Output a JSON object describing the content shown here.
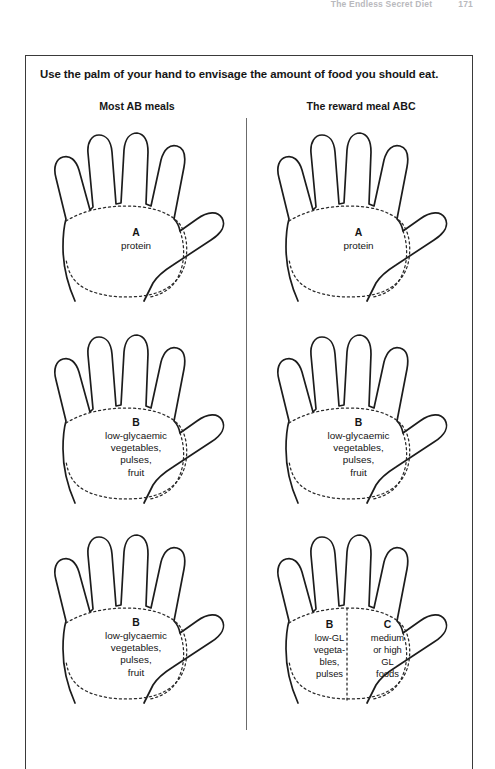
{
  "page_header": {
    "title": "The Endless Secret Diet",
    "page_number": "171"
  },
  "figure": {
    "caption": "Use the palm of your hand to envisage the amount of food you should eat.",
    "columns": [
      {
        "id": "left",
        "heading": "Most AB meals"
      },
      {
        "id": "right",
        "heading": "The reward meal ABC"
      }
    ],
    "cells": [
      {
        "id": "left-row1",
        "column": "left",
        "row": 1,
        "split": false,
        "label": {
          "letter": "A",
          "lines": [
            "protein"
          ]
        }
      },
      {
        "id": "right-row1",
        "column": "right",
        "row": 1,
        "split": false,
        "label": {
          "letter": "A",
          "lines": [
            "protein"
          ]
        }
      },
      {
        "id": "left-row2",
        "column": "left",
        "row": 2,
        "split": false,
        "label": {
          "letter": "B",
          "lines": [
            "low-glycaemic",
            "vegetables,",
            "pulses,",
            "fruit"
          ]
        }
      },
      {
        "id": "right-row2",
        "column": "right",
        "row": 2,
        "split": false,
        "label": {
          "letter": "B",
          "lines": [
            "low-glycaemic",
            "vegetables,",
            "pulses,",
            "fruit"
          ]
        }
      },
      {
        "id": "left-row3",
        "column": "left",
        "row": 3,
        "split": false,
        "label": {
          "letter": "B",
          "lines": [
            "low-glycaemic",
            "vegetables,",
            "pulses,",
            "fruit"
          ]
        }
      },
      {
        "id": "right-row3",
        "column": "right",
        "row": 3,
        "split": true,
        "label_left": {
          "letter": "B",
          "lines": [
            "low-GL",
            "vegeta-",
            "bles,",
            "pulses"
          ]
        },
        "label_right": {
          "letter": "C",
          "lines": [
            "medium",
            "or high",
            "GL",
            "foods"
          ]
        }
      }
    ]
  },
  "colors": {
    "ink": "#1c1c1c",
    "border": "#3a3a3a",
    "divider": "#6b6b6b",
    "dash": "#2a2a2a",
    "paper": "#ffffff",
    "header_faint": "#b9b9bd"
  }
}
